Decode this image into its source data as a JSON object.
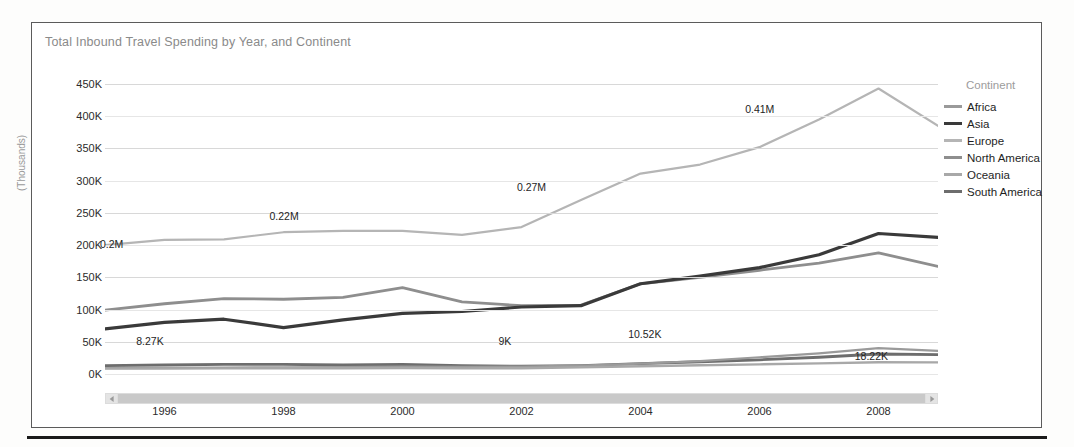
{
  "chart": {
    "title": "Total Inbound Travel Spending by Year, and Continent"
  },
  "legend": {
    "title": "Continent",
    "items": [
      {
        "label": "Africa",
        "color": "#9a9a9a",
        "width": 2.2
      },
      {
        "label": "Asia",
        "color": "#3a3a3a",
        "width": 3.2
      },
      {
        "label": "Europe",
        "color": "#b5b5b5",
        "width": 2.2
      },
      {
        "label": "North America",
        "color": "#8e8e8e",
        "width": 2.8
      },
      {
        "label": "Oceania",
        "color": "#a8a8a8",
        "width": 2.4
      },
      {
        "label": "South America",
        "color": "#6d6d6d",
        "width": 2.8
      }
    ]
  },
  "axes": {
    "y_title": "(Thousands)",
    "y_ticks": [
      "450K",
      "400K",
      "350K",
      "300K",
      "250K",
      "200K",
      "150K",
      "100K",
      "50K",
      "0K"
    ],
    "y_values": [
      450000,
      400000,
      350000,
      300000,
      250000,
      200000,
      150000,
      100000,
      50000,
      0
    ],
    "x_ticks": [
      "1996",
      "1998",
      "2000",
      "2002",
      "2004",
      "2006",
      "2008"
    ],
    "x_tick_values": [
      1996,
      1998,
      2000,
      2002,
      2004,
      2006,
      2008
    ]
  },
  "scrollbar": {
    "left_arrow": "scroll-left-arrow",
    "right_arrow": "scroll-right-arrow"
  },
  "chart_data": {
    "type": "line",
    "title": "Total Inbound Travel Spending by Year, and Continent",
    "xlabel": "",
    "ylabel": "(Thousands)",
    "xlim": [
      1995,
      2009
    ],
    "ylim": [
      0,
      450000
    ],
    "grid": true,
    "legend_position": "right",
    "x": [
      1995,
      1996,
      1997,
      1998,
      1999,
      2000,
      2001,
      2002,
      2003,
      2004,
      2005,
      2006,
      2007,
      2008,
      2009
    ],
    "series": [
      {
        "name": "Europe",
        "color": "#b5b5b5",
        "values": [
          200000,
          208000,
          209000,
          220000,
          222000,
          222000,
          216000,
          228000,
          270000,
          311000,
          325000,
          352000,
          395000,
          443000,
          385000
        ]
      },
      {
        "name": "North America",
        "color": "#8e8e8e",
        "values": [
          99000,
          109000,
          117000,
          116000,
          119000,
          134000,
          112000,
          106000,
          107000,
          140000,
          150000,
          161000,
          172000,
          188000,
          167000
        ]
      },
      {
        "name": "Asia",
        "color": "#3a3a3a",
        "values": [
          70000,
          80000,
          85000,
          72000,
          84000,
          94000,
          97000,
          104000,
          106000,
          140000,
          152000,
          165000,
          185000,
          218000,
          212000
        ]
      },
      {
        "name": "South America",
        "color": "#6d6d6d",
        "values": [
          13000,
          14000,
          15000,
          15000,
          14000,
          15000,
          13000,
          12000,
          13000,
          16000,
          19000,
          22000,
          26000,
          31000,
          30000
        ]
      },
      {
        "name": "Africa",
        "color": "#9a9a9a",
        "values": [
          9000,
          9500,
          10000,
          10500,
          10800,
          11500,
          11000,
          11500,
          13000,
          16000,
          20000,
          26000,
          32000,
          40000,
          36000
        ]
      },
      {
        "name": "Oceania",
        "color": "#a8a8a8",
        "values": [
          8270,
          8500,
          8800,
          9000,
          8900,
          9200,
          8800,
          9000,
          10520,
          12000,
          13500,
          15000,
          16500,
          18220,
          18000
        ]
      }
    ],
    "data_labels": [
      {
        "text": "0.2M",
        "x": 1995,
        "y": 200000,
        "px": 0.008,
        "py": 0.552
      },
      {
        "text": "0.22M",
        "x": 1998,
        "y": 220000,
        "px": 0.215,
        "py": 0.455
      },
      {
        "text": "0.27M",
        "x": 2003,
        "y": 270000,
        "px": 0.512,
        "py": 0.355
      },
      {
        "text": "0.41M",
        "x": 2007.6,
        "y": 410000,
        "px": 0.786,
        "py": 0.085
      },
      {
        "text": "8.27K",
        "x": 1995.7,
        "y": 8270,
        "px": 0.054,
        "py": 0.885
      },
      {
        "text": "9K",
        "x": 2001.9,
        "y": 9000,
        "px": 0.48,
        "py": 0.885
      },
      {
        "text": "10.52K",
        "x": 2003.6,
        "y": 10520,
        "px": 0.648,
        "py": 0.862
      },
      {
        "text": "18.22K",
        "x": 2008,
        "y": 18220,
        "px": 0.92,
        "py": 0.938
      }
    ]
  }
}
